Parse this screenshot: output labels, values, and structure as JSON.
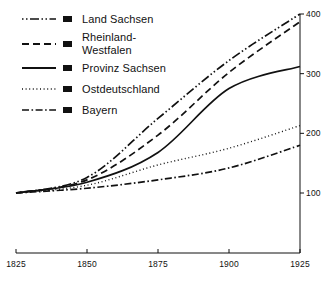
{
  "chart_data": {
    "type": "line",
    "title": "",
    "subtitle": "",
    "xlabel": "",
    "ylabel": "",
    "x": [
      1825,
      1850,
      1875,
      1900,
      1925
    ],
    "xlim": [
      1825,
      1925
    ],
    "ylim": [
      0,
      400
    ],
    "grid": false,
    "y_axis_position": "right",
    "xticks": [
      1825,
      1850,
      1875,
      1900,
      1925
    ],
    "xtick_labels": [
      "1825",
      "1850",
      "1875",
      "1900",
      "1925"
    ],
    "yticks": [
      100,
      200,
      300,
      400
    ],
    "ytick_labels": [
      "100",
      "200",
      "300",
      "400"
    ],
    "legend_position": "top-left",
    "series": [
      {
        "name": "Land Sachsen",
        "style": "dash-dot-dot",
        "values": [
          100,
          126,
          225,
          322,
          400
        ]
      },
      {
        "name": "Rheinland-\nWestfalen",
        "style": "dashed",
        "values": [
          100,
          122,
          197,
          302,
          387
        ]
      },
      {
        "name": "Provinz Sachsen",
        "style": "solid",
        "values": [
          100,
          118,
          168,
          275,
          312
        ]
      },
      {
        "name": "Ostdeutschland",
        "style": "dotted",
        "values": [
          100,
          113,
          147,
          175,
          213
        ]
      },
      {
        "name": "Bayern",
        "style": "dash-dot",
        "values": [
          100,
          108,
          122,
          142,
          180
        ]
      }
    ]
  },
  "colors": {
    "line": "#111111",
    "axis": "#111111",
    "background": "#ffffff"
  }
}
